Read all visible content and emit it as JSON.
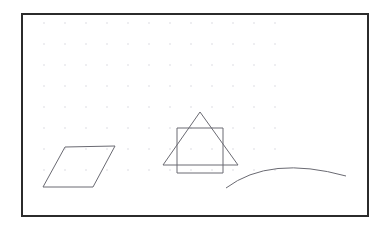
{
  "canvas": {
    "title": "Shapes Canvas",
    "background_color": "#ffffff",
    "border_color": "#2b2b2b",
    "border_width_px": 2,
    "frame": {
      "x": 21,
      "y": 13,
      "width": 348,
      "height": 204
    },
    "grid": {
      "visible": true,
      "dot_color": "#d8d8e0",
      "spacing_px": 21,
      "origin_x": 21,
      "origin_y": 21,
      "columns": 13,
      "rows": 8,
      "dot_radius_px": 0.8
    },
    "stroke_color": "#6a6a72",
    "stroke_width_px": 1
  },
  "chart_data": {
    "type": "scatter",
    "xlabel": "",
    "ylabel": "",
    "xlim": [
      0,
      344
    ],
    "ylim": [
      0,
      200
    ],
    "grid": true,
    "legend": "none",
    "shapes": [
      {
        "name": "parallelogram",
        "kind": "polygon",
        "closed": true,
        "points": [
          [
            42,
            132
          ],
          [
            92,
            131
          ],
          [
            70,
            172
          ],
          [
            20,
            172
          ]
        ]
      },
      {
        "name": "triangle",
        "kind": "polygon",
        "closed": true,
        "points": [
          [
            177,
            97
          ],
          [
            215,
            150
          ],
          [
            140,
            150
          ]
        ]
      },
      {
        "name": "square",
        "kind": "polygon",
        "closed": true,
        "points": [
          [
            154,
            113
          ],
          [
            200,
            113
          ],
          [
            200,
            158
          ],
          [
            154,
            158
          ]
        ]
      },
      {
        "name": "arc",
        "kind": "path",
        "closed": false,
        "path": "M 203,173 Q 247,140 323,161"
      }
    ]
  },
  "shapes_list": [
    {
      "label": "Parallelogram"
    },
    {
      "label": "Triangle"
    },
    {
      "label": "Square"
    },
    {
      "label": "Arc"
    }
  ]
}
